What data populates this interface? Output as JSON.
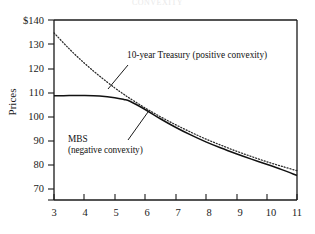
{
  "figure": {
    "cut_title": "CONVEXITY",
    "axis_label_y": "Prices",
    "y_ticks": [
      "$140",
      "130",
      "120",
      "110",
      "100",
      "90",
      "80",
      "70"
    ],
    "y_tick_values": [
      140,
      130,
      120,
      110,
      100,
      90,
      80,
      70
    ],
    "x_ticks": [
      "3",
      "4",
      "5",
      "6",
      "7",
      "8",
      "9",
      "10",
      "11"
    ],
    "x_tick_values": [
      3,
      4,
      5,
      6,
      7,
      8,
      9,
      10,
      11
    ],
    "annotations": {
      "treasury": "10-year Treasury (positive convexity)",
      "mbs_line1": "MBS",
      "mbs_line2": "(negative convexity)"
    },
    "colors": {
      "axis": "#1a1a1a",
      "treasury_line": "#2a2a2a",
      "mbs_line": "#111111",
      "background": "#ffffff"
    }
  },
  "chart_data": {
    "type": "line",
    "title": "CONVEXITY",
    "xlabel": "",
    "ylabel": "Prices",
    "xlim": [
      3,
      11
    ],
    "ylim": [
      70,
      140
    ],
    "grid": false,
    "legend": "annotations-inline",
    "x": [
      3,
      3.5,
      4,
      4.5,
      5,
      5.3,
      5.5,
      6,
      6.5,
      7,
      7.5,
      8,
      8.5,
      9,
      9.5,
      10,
      10.5,
      11
    ],
    "series": [
      {
        "name": "10-year Treasury (positive convexity)",
        "style": "dotted",
        "values": [
          135.0,
          128.8,
          123.2,
          118.2,
          113.6,
          111.1,
          109.5,
          105.8,
          102.4,
          99.3,
          96.4,
          93.7,
          91.3,
          89.0,
          86.9,
          84.9,
          83.1,
          81.4
        ]
      },
      {
        "name": "MBS (negative convexity)",
        "style": "solid",
        "values": [
          110.5,
          110.6,
          110.6,
          110.4,
          109.8,
          109.1,
          108.4,
          105.2,
          101.6,
          98.3,
          95.3,
          92.6,
          90.2,
          88.0,
          85.9,
          83.9,
          81.8,
          79.5
        ]
      }
    ],
    "annotations": [
      {
        "text": "10-year Treasury (positive convexity)",
        "x": 6.0,
        "y": 123.5
      },
      {
        "text": "MBS (negative convexity)",
        "x": 4.0,
        "y": 99.0
      }
    ]
  }
}
